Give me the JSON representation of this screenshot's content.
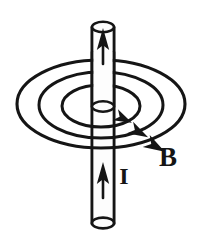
{
  "figure": {
    "background_color": "#ffffff",
    "stroke_color": "#151515",
    "labels": {
      "field_label": "B",
      "current_label": "I"
    },
    "label_positions": {
      "field_label": {
        "x": 168,
        "y": 166
      },
      "current_label": {
        "x": 124,
        "y": 183
      }
    },
    "wire": {
      "name": "straight-conductor",
      "axis_x": 103,
      "top_y": 22,
      "bottom_y": 224,
      "radius_x": 11,
      "cap_radius_y": 5,
      "fill": "#fdfdfd"
    },
    "current_arrows": [
      {
        "name": "current-arrow-top",
        "x": 103,
        "tail_y": 62,
        "tip_y": 30
      },
      {
        "name": "current-arrow-bottom",
        "x": 103,
        "tail_y": 196,
        "tip_y": 164
      }
    ],
    "field_rings": [
      {
        "name": "field-ring-outer",
        "cx": 101,
        "cy": 104,
        "rx": 84,
        "ry": 44,
        "stroke_width": 3.0,
        "arrow_at_deg": 38
      },
      {
        "name": "field-ring-middle",
        "cx": 101,
        "cy": 105,
        "rx": 62,
        "ry": 33,
        "stroke_width": 3.0,
        "arrow_at_deg": 42
      },
      {
        "name": "field-ring-inner",
        "cx": 101,
        "cy": 106,
        "rx": 39,
        "ry": 21,
        "stroke_width": 3.0,
        "arrow_at_deg": 44
      }
    ],
    "arrowheads": [
      {
        "name": "field-direction-arrow-inner",
        "x": 122,
        "y": 119,
        "angle_deg": 28
      },
      {
        "name": "field-direction-arrow-middle",
        "x": 137,
        "y": 132,
        "angle_deg": 30
      },
      {
        "name": "field-direction-arrow-outer",
        "x": 153,
        "y": 146,
        "angle_deg": 32
      }
    ]
  }
}
